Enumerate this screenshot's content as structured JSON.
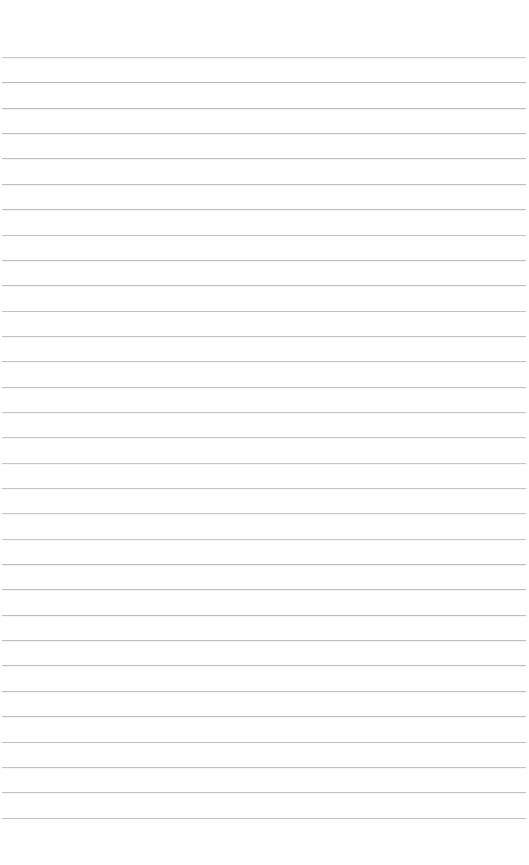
{
  "page": {
    "kind": "ruled-paper",
    "width": 529,
    "height": 865,
    "background_color": "#ffffff",
    "content_text": "",
    "is_blank": true
  },
  "ruling": {
    "line_color": "#b9bdc1",
    "line_thickness": 1,
    "line_count": 31,
    "line_spacing": 25.35,
    "first_line_y": 57,
    "last_line_y": 818,
    "line_start_x": 2,
    "line_end_x": 526,
    "line_length": 524,
    "top_margin": 57,
    "bottom_margin": 47,
    "left_margin": 2,
    "right_margin": 3,
    "has_vertical_margin_rule": false,
    "has_header_rule": false,
    "has_border": false,
    "line_y_positions": [
      57,
      82.4,
      107.7,
      133.1,
      158.4,
      183.8,
      209.1,
      234.5,
      259.8,
      285.2,
      310.5,
      335.9,
      361.2,
      386.6,
      411.9,
      437.3,
      462.6,
      488,
      513.3,
      538.7,
      564,
      589.4,
      614.7,
      640.1,
      665.4,
      690.8,
      716.1,
      741.5,
      766.8,
      792.2,
      817.5
    ]
  }
}
